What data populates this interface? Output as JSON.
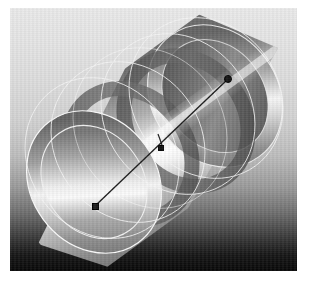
{
  "scene": {
    "title": "3D cylinder shaded render with axis manipulator",
    "object_type": "cylinder-tube",
    "background_gradient": [
      "#e9e9e9",
      "#070707"
    ],
    "material_color": "#b9b9b9",
    "highlight_color": "#ffffff",
    "shadow_color": "#4a4a4a",
    "wireframe_color": "#f2f2f2",
    "axis_color": "#1b1b1b"
  },
  "canvas": {
    "x": 10,
    "y": 8,
    "width": 287,
    "height": 263
  },
  "axis_manipulator": {
    "label": "axis-line",
    "start": {
      "x": 85,
      "y": 198,
      "handle": "square"
    },
    "end": {
      "x": 218,
      "y": 71,
      "handle": "dot"
    },
    "mid": {
      "x": 150,
      "y": 139,
      "handle": "square"
    },
    "tick": {
      "x": 148,
      "y": 126,
      "length": 11
    }
  },
  "tube": {
    "near_ring": {
      "cx": 82,
      "cy": 176,
      "rx": 64,
      "ry": 74,
      "rotate": -36,
      "thickness": 14
    },
    "far_ring": {
      "cx": 207,
      "cy": 90,
      "rx": 64,
      "ry": 74,
      "rotate": -36,
      "thickness": 14
    },
    "inner_ring_near": {
      "cx": 112,
      "cy": 150,
      "rx": 54,
      "ry": 62,
      "rotate": -36
    },
    "inner_ring_far": {
      "cx": 178,
      "cy": 114,
      "rx": 54,
      "ry": 62,
      "rotate": -36
    }
  },
  "wireframe_circles": [
    {
      "cx": 96,
      "cy": 150,
      "rx": 72,
      "ry": 80,
      "rotate": -36
    },
    {
      "cx": 120,
      "cy": 132,
      "rx": 72,
      "ry": 80,
      "rotate": -36
    },
    {
      "cx": 168,
      "cy": 110,
      "rx": 72,
      "ry": 80,
      "rotate": -36
    },
    {
      "cx": 196,
      "cy": 96,
      "rx": 72,
      "ry": 80,
      "rotate": -36
    }
  ],
  "page_margin_color": "#ffffff"
}
